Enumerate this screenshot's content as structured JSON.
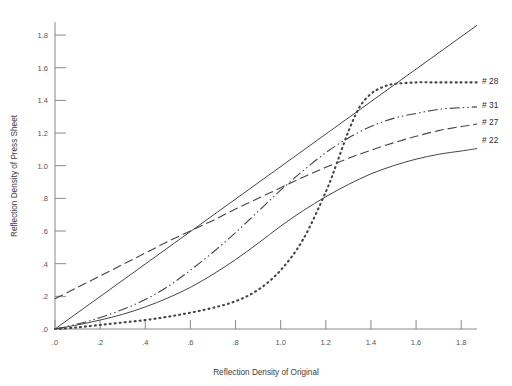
{
  "chart_data": {
    "type": "line",
    "title": "",
    "xlabel": "Reflection Density of Original",
    "ylabel": "Reflection Density of Press Sheet",
    "xlim": [
      0.0,
      1.87
    ],
    "ylim": [
      0.0,
      1.88
    ],
    "xticks": [
      0.0,
      0.2,
      0.4,
      0.6,
      0.8,
      1.0,
      1.2,
      1.4,
      1.6,
      1.8
    ],
    "xticklabels": [
      ".0",
      ".2",
      ".4",
      ".6",
      ".8",
      "1.0",
      "1.2",
      "1.4",
      "1.6",
      "1.8"
    ],
    "yticks": [
      0.0,
      0.2,
      0.4,
      0.6,
      0.8,
      1.0,
      1.2,
      1.4,
      1.6,
      1.8
    ],
    "yticklabels": [
      ".0",
      ".2",
      ".4",
      ".6",
      ".8",
      "1.0",
      "1.2",
      "1.4",
      "1.6",
      "1.8"
    ],
    "grid": false,
    "legend_position": "right-of-curve-ends",
    "line_color": "#454545",
    "axis_color": "#8a8a8a",
    "series": [
      {
        "name": "#28",
        "label": "# 28",
        "linestyle": "dotted",
        "dash": "1,4",
        "width": 2.1,
        "label_x": 1.9,
        "label_y": 1.52,
        "x": [
          0.0,
          0.1,
          0.2,
          0.3,
          0.4,
          0.5,
          0.6,
          0.7,
          0.8,
          0.9,
          1.0,
          1.1,
          1.2,
          1.25,
          1.3,
          1.35,
          1.4,
          1.45,
          1.5,
          1.6,
          1.7,
          1.8,
          1.87
        ],
        "y": [
          0.0,
          0.01,
          0.025,
          0.04,
          0.055,
          0.075,
          0.1,
          0.13,
          0.17,
          0.24,
          0.36,
          0.55,
          0.84,
          1.02,
          1.21,
          1.36,
          1.44,
          1.48,
          1.5,
          1.51,
          1.51,
          1.51,
          1.51
        ]
      },
      {
        "name": "#31",
        "label": "# 31",
        "linestyle": "dash-dot-dot",
        "dash": "10,3,1.5,3,1.5,3",
        "width": 1.1,
        "label_x": 1.9,
        "label_y": 1.37,
        "x": [
          0.0,
          0.1,
          0.2,
          0.3,
          0.4,
          0.5,
          0.6,
          0.7,
          0.8,
          0.9,
          1.0,
          1.1,
          1.2,
          1.3,
          1.4,
          1.5,
          1.6,
          1.7,
          1.8,
          1.87
        ],
        "y": [
          0.0,
          0.03,
          0.07,
          0.12,
          0.18,
          0.26,
          0.36,
          0.47,
          0.59,
          0.72,
          0.85,
          0.97,
          1.08,
          1.17,
          1.24,
          1.29,
          1.32,
          1.345,
          1.355,
          1.36
        ]
      },
      {
        "name": "#27",
        "label": "# 27",
        "linestyle": "long-dash",
        "dash": "9,4",
        "width": 1.1,
        "label_x": 1.9,
        "label_y": 1.27,
        "x": [
          0.0,
          0.1,
          0.2,
          0.3,
          0.4,
          0.5,
          0.6,
          0.7,
          0.8,
          0.9,
          1.0,
          1.1,
          1.2,
          1.3,
          1.4,
          1.5,
          1.6,
          1.7,
          1.8,
          1.87
        ],
        "y": [
          0.185,
          0.255,
          0.325,
          0.395,
          0.465,
          0.535,
          0.6,
          0.665,
          0.735,
          0.8,
          0.865,
          0.93,
          0.99,
          1.045,
          1.095,
          1.14,
          1.18,
          1.215,
          1.24,
          1.255
        ]
      },
      {
        "name": "#22",
        "label": "# 22",
        "linestyle": "solid",
        "dash": "",
        "width": 1.0,
        "label_x": 1.9,
        "label_y": 1.155,
        "x": [
          0.0,
          0.1,
          0.2,
          0.3,
          0.4,
          0.5,
          0.6,
          0.7,
          0.8,
          0.9,
          1.0,
          1.1,
          1.2,
          1.3,
          1.4,
          1.5,
          1.6,
          1.7,
          1.8,
          1.87
        ],
        "y": [
          0.0,
          0.025,
          0.055,
          0.09,
          0.135,
          0.19,
          0.255,
          0.335,
          0.425,
          0.525,
          0.63,
          0.725,
          0.81,
          0.885,
          0.95,
          1.0,
          1.04,
          1.07,
          1.09,
          1.105
        ]
      },
      {
        "name": "reference-line",
        "label": "",
        "linestyle": "solid",
        "dash": "",
        "width": 1.0,
        "label_x": null,
        "label_y": null,
        "x": [
          0.0,
          1.87
        ],
        "y": [
          0.0,
          1.86
        ]
      }
    ]
  }
}
